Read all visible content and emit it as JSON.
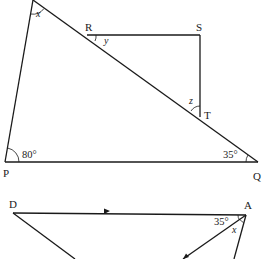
{
  "figure1": {
    "vertices": {
      "P": "P",
      "Q": "Q",
      "R": "R",
      "S": "S",
      "T": "T"
    },
    "angles": {
      "top_vertex": "x",
      "at_R": "y",
      "at_T": "z",
      "at_P": "80°",
      "at_Q": "35°"
    }
  },
  "figure2": {
    "vertices": {
      "D": "D",
      "A": "A"
    },
    "angles": {
      "at_A_upper": "35°",
      "at_A_lower": "x"
    },
    "parallel_arrow": "arrow-right"
  }
}
